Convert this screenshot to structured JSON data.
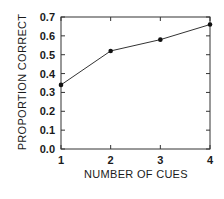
{
  "chart_data": {
    "type": "line",
    "title": "",
    "xlabel": "NUMBER OF CUES",
    "ylabel": "PROPORTION CORRECT",
    "x": [
      1,
      2,
      3,
      4
    ],
    "categories": [
      "1",
      "2",
      "3",
      "4"
    ],
    "series": [
      {
        "name": "Proportion correct",
        "values": [
          0.34,
          0.52,
          0.58,
          0.66
        ]
      }
    ],
    "xlim": [
      1,
      4
    ],
    "ylim": [
      0.0,
      0.7
    ],
    "yticks": [
      "0.0",
      "0.1",
      "0.2",
      "0.3",
      "0.4",
      "0.5",
      "0.6",
      "0.7"
    ],
    "xticks": [
      "1",
      "2",
      "3",
      "4"
    ],
    "grid": false,
    "legend": null,
    "line_color": "#333333",
    "marker_color": "#111111"
  }
}
